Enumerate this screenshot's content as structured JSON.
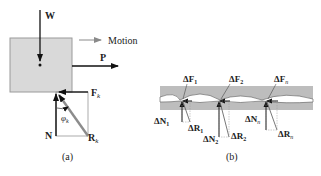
{
  "panel_a": {
    "caption": "(a)",
    "labels": {
      "weight": "W",
      "motion": "Motion",
      "applied_force": "P",
      "friction": "F",
      "friction_sub": "k",
      "normal": "N",
      "resultant": "R",
      "resultant_sub": "k",
      "angle": "φ",
      "angle_sub": "k"
    }
  },
  "panel_b": {
    "caption": "(b)",
    "labels": {
      "dF1": "ΔF",
      "dF1_sub": "1",
      "dF2": "ΔF",
      "dF2_sub": "2",
      "dFn": "ΔF",
      "dFn_sub": "n",
      "dN1": "ΔN",
      "dN1_sub": "1",
      "dN2": "ΔN",
      "dN2_sub": "2",
      "dNn": "ΔN",
      "dNn_sub": "n",
      "dR1": "ΔR",
      "dR1_sub": "1",
      "dR2": "ΔR",
      "dR2_sub": "2",
      "dRn": "ΔR",
      "dRn_sub": "n"
    }
  },
  "colors": {
    "block_fill": "#d9d9d9",
    "block_stroke": "#9a9a9a",
    "band_fill": "#bdbdbd",
    "arrow": "#111111",
    "resultant": "#8c8c8c",
    "motion_arrow": "#8a8a8a"
  }
}
